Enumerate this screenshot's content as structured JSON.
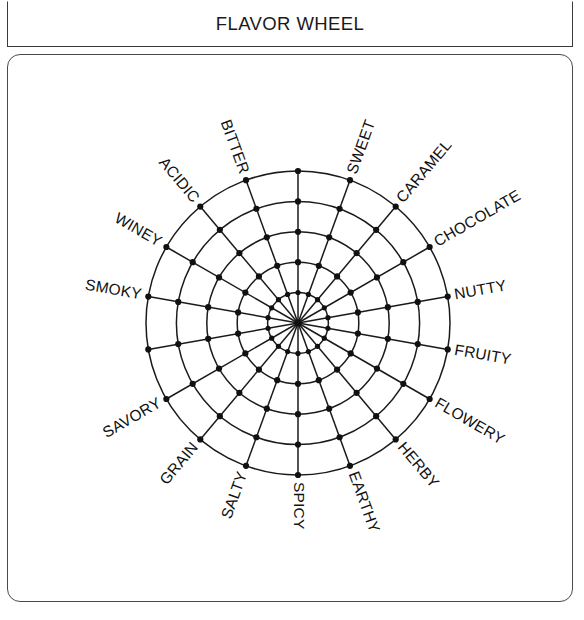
{
  "header": {
    "title": "FLAVOR WHEEL"
  },
  "chart_data": {
    "type": "radar",
    "title": "FLAVOR WHEEL",
    "subtitle": "",
    "xlabel": "",
    "ylabel": "",
    "grid": true,
    "legend": "none",
    "rings": 5,
    "ring_values": [
      1,
      2,
      3,
      4,
      5
    ],
    "rlim": [
      0,
      5
    ],
    "tick_labels": [],
    "center": {
      "x": 298,
      "y": 323
    },
    "outer_radius": 152,
    "spoke_count": 18,
    "categories": [
      "SWEET",
      "CARAMEL",
      "CHOCOLATE",
      "NUTTY",
      "FRUITY",
      "FLOWERY",
      "HERBY",
      "EARTHY",
      "SPICY",
      "SALTY",
      "GRAIN",
      "SAVORY",
      "SMOKY",
      "WINEY",
      "ACIDIC",
      "BITTER"
    ],
    "axes": [
      {
        "label": "SWEET",
        "angle_deg": 70
      },
      {
        "label": "CARAMEL",
        "angle_deg": 50
      },
      {
        "label": "CHOCOLATE",
        "angle_deg": 30
      },
      {
        "label": "NUTTY",
        "angle_deg": 10
      },
      {
        "label": "FRUITY",
        "angle_deg": -10
      },
      {
        "label": "FLOWERY",
        "angle_deg": -30
      },
      {
        "label": "HERBY",
        "angle_deg": -50
      },
      {
        "label": "EARTHY",
        "angle_deg": -70
      },
      {
        "label": "SPICY",
        "angle_deg": -90
      },
      {
        "label": "SALTY",
        "angle_deg": -110
      },
      {
        "label": "GRAIN",
        "angle_deg": -130
      },
      {
        "label": "SAVORY",
        "angle_deg": -150
      },
      {
        "label": "SMOKY",
        "angle_deg": 170
      },
      {
        "label": "WINEY",
        "angle_deg": 150
      },
      {
        "label": "ACIDIC",
        "angle_deg": 130
      },
      {
        "label": "BITTER",
        "angle_deg": 110
      },
      {
        "label": "",
        "angle_deg": 90
      },
      {
        "label": "",
        "angle_deg": -170
      }
    ],
    "colors": {
      "stroke": "#1a1a1a",
      "node": "#111111",
      "background": "#ffffff",
      "frame": "#4a4a4a"
    }
  }
}
